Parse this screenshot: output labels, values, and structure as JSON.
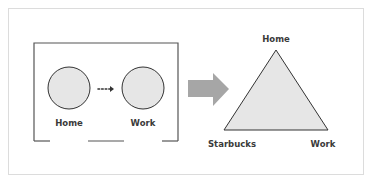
{
  "left_panel": {
    "nodes": [
      {
        "id": "home",
        "label": "Home"
      },
      {
        "id": "work",
        "label": "Work"
      }
    ],
    "edge": {
      "from": "home",
      "to": "work",
      "style": "dotted-arrow"
    }
  },
  "transition_arrow": {
    "icon": "right-arrow-icon",
    "color": "#a6a6a6"
  },
  "right_panel": {
    "shape": "triangle",
    "vertices": [
      {
        "id": "home",
        "label": "Home",
        "position": "top"
      },
      {
        "id": "starbucks",
        "label": "Starbucks",
        "position": "bottom-left"
      },
      {
        "id": "work",
        "label": "Work",
        "position": "bottom-right"
      }
    ]
  },
  "colors": {
    "fill": "#e6e6e6",
    "stroke": "#333333",
    "box_stroke": "#555555",
    "frame": "#dcdcdc",
    "arrow": "#a6a6a6",
    "text": "#3a3a3a"
  }
}
